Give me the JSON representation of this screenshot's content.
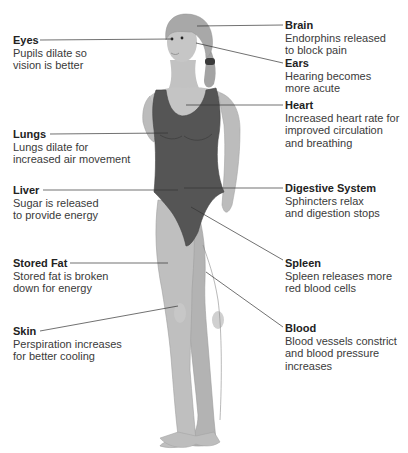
{
  "diagram": {
    "colors": {
      "background": "#ffffff",
      "skin": "#bdbdbd",
      "skin_shadow": "#a8a8a8",
      "swimsuit": "#555555",
      "hair": "#9e9e9e",
      "leader_line": "#333333",
      "title_text": "#222222",
      "desc_text": "#3a3a3a"
    },
    "labels_left": [
      {
        "id": "eyes",
        "title": "Eyes",
        "desc": "Pupils dilate so\nvision is better"
      },
      {
        "id": "lungs",
        "title": "Lungs",
        "desc": "Lungs dilate for\nincreased air movement"
      },
      {
        "id": "liver",
        "title": "Liver",
        "desc": "Sugar is released\nto provide energy"
      },
      {
        "id": "stored-fat",
        "title": "Stored Fat",
        "desc": "Stored fat is broken\ndown for energy"
      },
      {
        "id": "skin",
        "title": "Skin",
        "desc": "Perspiration increases\nfor better cooling"
      }
    ],
    "labels_right": [
      {
        "id": "brain",
        "title": "Brain",
        "desc": "Endorphins released\nto block pain"
      },
      {
        "id": "ears",
        "title": "Ears",
        "desc": "Hearing becomes\nmore acute"
      },
      {
        "id": "heart",
        "title": "Heart",
        "desc": "Increased heart rate for\nimproved circulation\nand breathing"
      },
      {
        "id": "digestive-system",
        "title": "Digestive System",
        "desc": "Sphincters relax\nand digestion stops"
      },
      {
        "id": "spleen",
        "title": "Spleen",
        "desc": "Spleen releases more\nred blood cells"
      },
      {
        "id": "blood",
        "title": "Blood",
        "desc": "Blood vessels constrict\nand blood pressure\nincreases"
      }
    ]
  }
}
